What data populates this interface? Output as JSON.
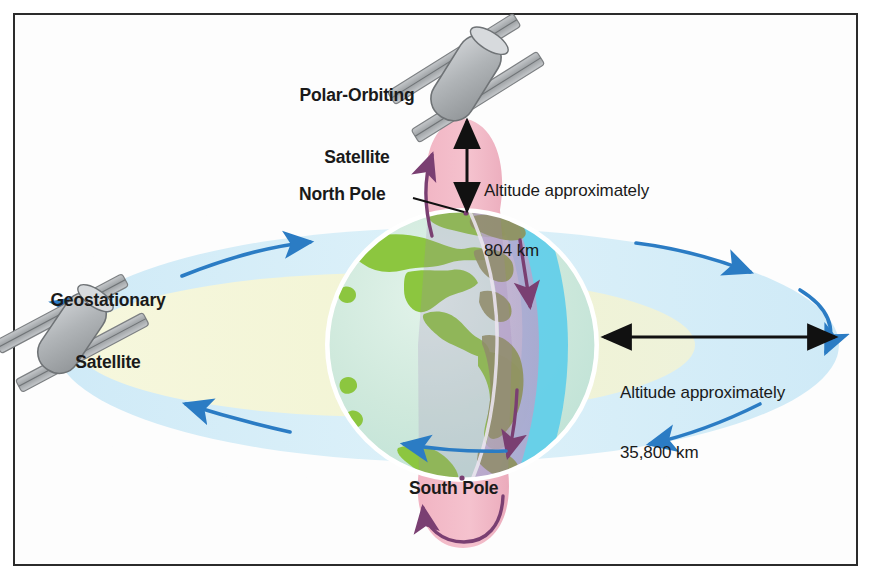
{
  "figure": {
    "background_color": "#ffffff",
    "frame_color": "#2b2b2b"
  },
  "labels": {
    "polar_satellite_line1": "Polar-Orbiting",
    "polar_satellite_line2": "Satellite",
    "geostationary_satellite_line1": "Geostationary",
    "geostationary_satellite_line2": "Satellite",
    "north_pole": "North Pole",
    "south_pole": "South Pole",
    "altitude_polar_line1": "Altitude approximately",
    "altitude_polar_line2": "804 km",
    "altitude_geo_line1": "Altitude approximately",
    "altitude_geo_line2": "35,800 km"
  },
  "colors": {
    "earth_ocean": "#cfe8dc",
    "earth_land": "#8cc63f",
    "earth_night_land": "#8d9157",
    "earth_night_ocean": "#b9a8cc",
    "earth_right_limb": "#5ecbe8",
    "polar_orbit_band": "#f2b8c6",
    "geo_orbit_outer": "#d6eef8",
    "geo_orbit_inner": "#f4f5d8",
    "orbit_arrow_blue": "#2b7cc4",
    "orbit_arrow_purple": "#7a3f72",
    "dimension_arrow": "#111111",
    "satellite_body": "#b4b7ba",
    "satellite_panel": "#9a9da0",
    "text": "#1a1a1a"
  },
  "annotations": {
    "polar_altitude_km": 804,
    "geostationary_altitude_km": 35800,
    "polar_orbit_direction": "north-to-south over poles",
    "geostationary_orbit_direction": "west-to-east around equator"
  },
  "icons": {
    "polar_satellite": "satellite-icon",
    "geostationary_satellite": "satellite-icon",
    "earth": "globe-icon"
  }
}
